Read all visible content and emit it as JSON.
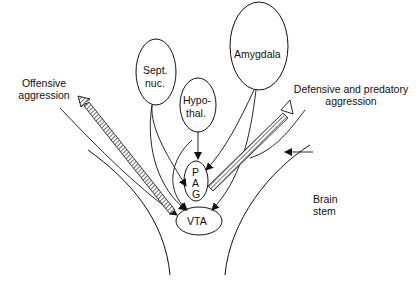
{
  "diagram": {
    "nodes": {
      "amygdala": "Amygdala",
      "sept_nuc_1": "Sept.",
      "sept_nuc_2": "nuc.",
      "hypothal_1": "Hypo-",
      "hypothal_2": "thal.",
      "pag_p": "P",
      "pag_a": "A",
      "pag_g": "G",
      "vta": "VTA"
    },
    "labels": {
      "offensive_1": "Offensive",
      "offensive_2": "aggression",
      "defensive_1": "Defensive and predatory",
      "defensive_2": "aggression",
      "brain_stem_1": "Brain",
      "brain_stem_2": "stem"
    }
  }
}
